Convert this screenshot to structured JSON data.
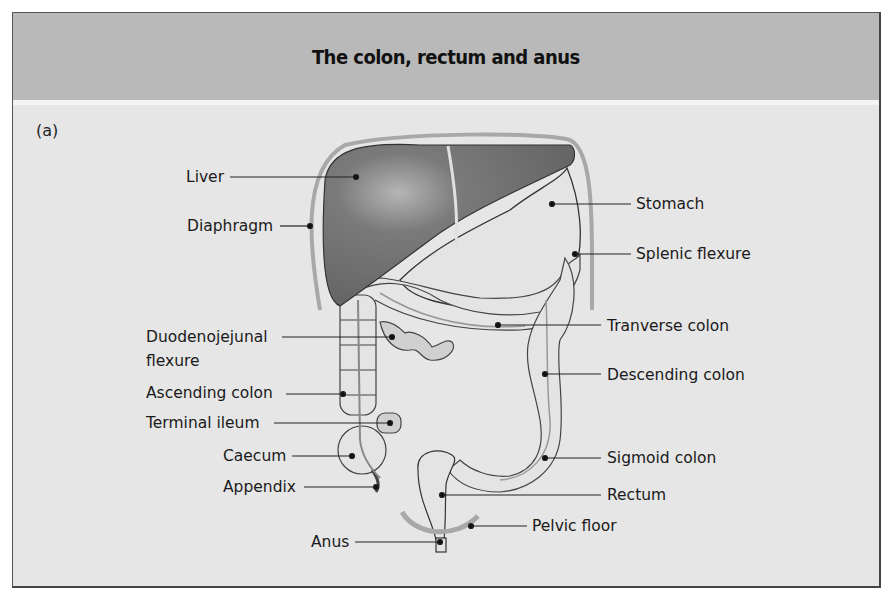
{
  "header": {
    "title": "The colon, rectum and anus"
  },
  "panel": {
    "label": "(a)"
  },
  "colors": {
    "frame_background": "#e6e6e6",
    "header_background": "#b9b9b9",
    "liver": "#6f6f6f",
    "organ_fill": "#e2e2e2",
    "outline": "#3a3a3a",
    "diaphragm": "#a8a8a8"
  },
  "labels": {
    "left": [
      {
        "id": "liver",
        "text": "Liver"
      },
      {
        "id": "diaphragm",
        "text": "Diaphragm"
      },
      {
        "id": "duodenojejunal",
        "text": "Duodenojejunal",
        "text2": "flexure"
      },
      {
        "id": "ascending",
        "text": "Ascending colon"
      },
      {
        "id": "terminal_ileum",
        "text": "Terminal ileum"
      },
      {
        "id": "caecum",
        "text": "Caecum"
      },
      {
        "id": "appendix",
        "text": "Appendix"
      },
      {
        "id": "anus",
        "text": "Anus"
      }
    ],
    "right": [
      {
        "id": "stomach",
        "text": "Stomach"
      },
      {
        "id": "splenic",
        "text": "Splenic flexure"
      },
      {
        "id": "transverse",
        "text": "Tranverse colon"
      },
      {
        "id": "descending",
        "text": "Descending colon"
      },
      {
        "id": "sigmoid",
        "text": "Sigmoid colon"
      },
      {
        "id": "rectum",
        "text": "Rectum"
      },
      {
        "id": "pelvic_floor",
        "text": "Pelvic floor"
      }
    ]
  }
}
